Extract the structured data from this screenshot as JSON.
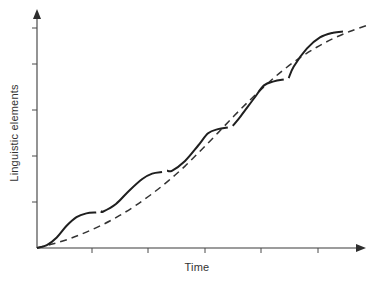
{
  "chart_data": {
    "type": "line",
    "title": "",
    "subtitle": "",
    "xlabel": "Time",
    "ylabel": "Linguistic elements",
    "grid": false,
    "legend": "none",
    "xlim": [
      0,
      1
    ],
    "ylim": [
      0,
      1
    ],
    "axis_style": "arrow-headed open axes, no numeric tick labels",
    "x_tick_count": 5,
    "y_tick_count": 5,
    "x_tick_positions": [
      0.17,
      0.33,
      0.5,
      0.66,
      0.82
    ],
    "y_tick_positions": [
      0.2,
      0.4,
      0.6,
      0.8,
      0.96
    ],
    "annotations": [],
    "series": [
      {
        "name": "continuous-growth",
        "style": "dashed",
        "color": "#333333",
        "description": "Smooth sigmoid curve of gradual continuous growth",
        "x": [
          0.0,
          0.05,
          0.1,
          0.15,
          0.2,
          0.25,
          0.3,
          0.35,
          0.4,
          0.45,
          0.5,
          0.55,
          0.6,
          0.65,
          0.7,
          0.75,
          0.8,
          0.85,
          0.9,
          0.95,
          1.0
        ],
        "y": [
          0.0,
          0.018,
          0.04,
          0.068,
          0.1,
          0.138,
          0.182,
          0.232,
          0.288,
          0.35,
          0.42,
          0.492,
          0.566,
          0.636,
          0.702,
          0.762,
          0.814,
          0.858,
          0.895,
          0.925,
          0.95
        ]
      },
      {
        "name": "stepwise-growth",
        "style": "solid-stepped",
        "color": "#1f1f1f",
        "description": "Stepwise staircase sigmoid with plateaus separated by small discontinuity gaps; oscillates around the dashed curve",
        "plateau_count": 6,
        "x": [
          0.0,
          0.03,
          0.06,
          0.09,
          0.12,
          0.15,
          0.18,
          0.2,
          0.24,
          0.28,
          0.32,
          0.35,
          0.38,
          0.41,
          0.45,
          0.49,
          0.52,
          0.55,
          0.58,
          0.62,
          0.66,
          0.69,
          0.72,
          0.75,
          0.78,
          0.82,
          0.86,
          0.9,
          0.93
        ],
        "y": [
          0.0,
          0.012,
          0.045,
          0.095,
          0.132,
          0.148,
          0.152,
          0.155,
          0.188,
          0.245,
          0.295,
          0.318,
          0.325,
          0.33,
          0.372,
          0.438,
          0.49,
          0.508,
          0.515,
          0.565,
          0.64,
          0.695,
          0.712,
          0.72,
          0.775,
          0.852,
          0.9,
          0.92,
          0.925
        ]
      }
    ]
  },
  "figure": {
    "background_color": "#ffffff",
    "axis_color": "#3b3b3b",
    "solid_curve_color": "#1f1f1f",
    "dashed_curve_color": "#333333"
  },
  "labels": {
    "x_axis": "Time",
    "y_axis": "Linguistic elements"
  }
}
